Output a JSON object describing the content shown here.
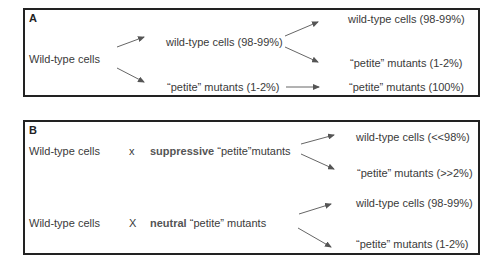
{
  "panel_a": {
    "label": "A",
    "source": "Wild-type cells",
    "mid_upper": "wild-type cells (98-99%)",
    "mid_lower": "“petite”  mutants (1-2%)",
    "right_1": "wild-type cells (98-99%)",
    "right_2": "“petite” mutants (1-2%)",
    "right_3": "“petite” mutants (100%)"
  },
  "panel_b": {
    "label": "B",
    "cross_1": {
      "left": "Wild-type cells",
      "symbol": "x",
      "partner_bold": "suppressive",
      "partner_rest": " “petite”mutants",
      "outcome_upper": "wild-type cells (<<98%)",
      "outcome_lower": "“petite” mutants (>>2%)"
    },
    "cross_2": {
      "left": "Wild-type cells",
      "symbol": "X",
      "partner_bold": "neutral",
      "partner_rest": "  “petite” mutants",
      "outcome_upper": "wild-type cells (98-99%)",
      "outcome_lower": "“petite” mutants (1-2%)"
    }
  },
  "colors": {
    "border": "#222222",
    "text": "#3a3a3a",
    "arrow": "#555555"
  }
}
